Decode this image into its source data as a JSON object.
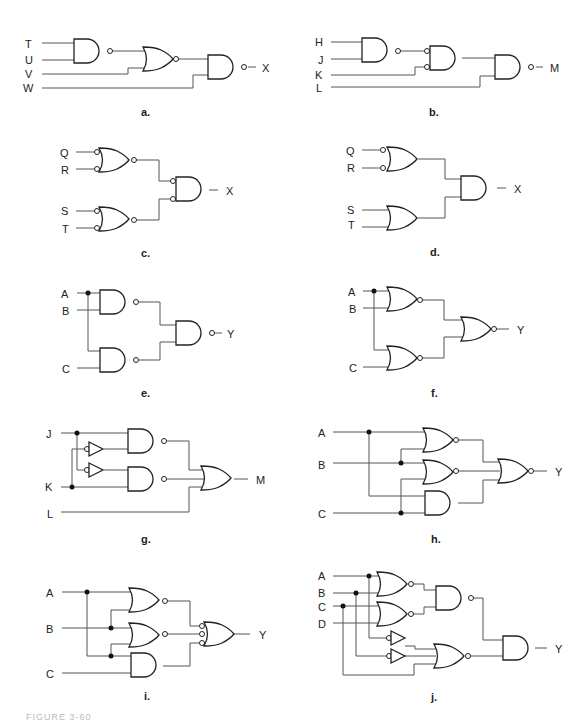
{
  "diagrams": [
    {
      "id": "a",
      "caption": "a.",
      "inputs": [
        "T",
        "U",
        "V",
        "W"
      ],
      "output": "X",
      "gates": [
        "NAND(T,U)",
        "NOR(prev,V)",
        "NAND(prev,W)"
      ]
    },
    {
      "id": "b",
      "caption": "b.",
      "inputs": [
        "H",
        "J",
        "K",
        "L"
      ],
      "output": "M",
      "gates": [
        "NAND(H,J)",
        "AND(inverted inputs: prev,K)",
        "NAND(prev,L)"
      ]
    },
    {
      "id": "c",
      "caption": "c.",
      "inputs": [
        "Q",
        "R",
        "S",
        "T"
      ],
      "output": "X",
      "gates": [
        "NOR(inverted inputs: Q,R)",
        "NOR(inverted inputs: S,T)",
        "AND(inverted inputs)"
      ]
    },
    {
      "id": "d",
      "caption": "d.",
      "inputs": [
        "Q",
        "R",
        "S",
        "T"
      ],
      "output": "X",
      "gates": [
        "OR(inverted inputs: Q,R)",
        "OR(S,T)",
        "AND"
      ]
    },
    {
      "id": "e",
      "caption": "e.",
      "inputs": [
        "A",
        "B",
        "C"
      ],
      "output": "Y",
      "gates": [
        "NAND(A,B)",
        "NAND(A,C)",
        "NAND"
      ]
    },
    {
      "id": "f",
      "caption": "f.",
      "inputs": [
        "A",
        "B",
        "C"
      ],
      "output": "Y",
      "gates": [
        "NOR(A,B)",
        "NOR(A,C)",
        "NOR"
      ]
    },
    {
      "id": "g",
      "caption": "g.",
      "inputs": [
        "J",
        "K",
        "L"
      ],
      "output": "M",
      "gates": [
        "NAND(J,NOT K)",
        "NAND(NOT J,K)",
        "OR(prev1,prev2,L)"
      ]
    },
    {
      "id": "h",
      "caption": "h.",
      "inputs": [
        "A",
        "B",
        "C"
      ],
      "output": "Y",
      "gates": [
        "NOR(A,B)",
        "NOR(B,C)",
        "AND(A,C)",
        "NOR(3 inputs)"
      ]
    },
    {
      "id": "i",
      "caption": "i.",
      "inputs": [
        "A",
        "B",
        "C"
      ],
      "output": "Y",
      "gates": [
        "NOR(A,B)",
        "NOR(B,C)",
        "AND(A,C)",
        "OR(3 inverted inputs)"
      ]
    },
    {
      "id": "j",
      "caption": "j.",
      "inputs": [
        "A",
        "B",
        "C",
        "D"
      ],
      "output": "Y",
      "gates": [
        "NOR(A,B)",
        "NOR(C,D)",
        "NAND",
        "NOT A",
        "NOT B",
        "NOR(NOT A, NOT B, C)",
        "AND"
      ]
    }
  ],
  "labels": {
    "a": {
      "T": "T",
      "U": "U",
      "V": "V",
      "W": "W",
      "out": "X"
    },
    "b": {
      "H": "H",
      "J": "J",
      "K": "K",
      "L": "L",
      "out": "M"
    },
    "c": {
      "Q": "Q",
      "R": "R",
      "S": "S",
      "T": "T",
      "out": "X"
    },
    "d": {
      "Q": "Q",
      "R": "R",
      "S": "S",
      "T": "T",
      "out": "X"
    },
    "e": {
      "A": "A",
      "B": "B",
      "C": "C",
      "out": "Y"
    },
    "f": {
      "A": "A",
      "B": "B",
      "C": "C",
      "out": "Y"
    },
    "g": {
      "J": "J",
      "K": "K",
      "L": "L",
      "out": "M"
    },
    "h": {
      "A": "A",
      "B": "B",
      "C": "C",
      "out": "Y"
    },
    "i": {
      "A": "A",
      "B": "B",
      "C": "C",
      "out": "Y"
    },
    "j": {
      "A": "A",
      "B": "B",
      "C": "C",
      "D": "D",
      "out": "Y"
    }
  },
  "captions": {
    "a": "a.",
    "b": "b.",
    "c": "c.",
    "d": "d.",
    "e": "e.",
    "f": "f.",
    "g": "g.",
    "h": "h.",
    "i": "i.",
    "j": "j."
  },
  "figure_caption": "FIGURE 3-60"
}
